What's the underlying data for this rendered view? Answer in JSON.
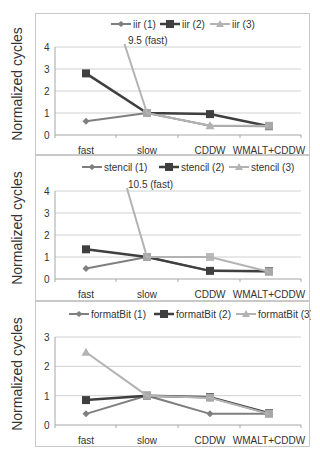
{
  "ylabel": "Normalized cycles",
  "colors": {
    "s1": "#7f7f7f",
    "s2": "#3f3f3f",
    "s3": "#b3b3b3",
    "grid": "#d0d0d0",
    "axis": "#a6a6a6"
  },
  "chart_data": [
    {
      "type": "line",
      "title": "",
      "xlabel": "",
      "ylabel": "Normalized cycles",
      "categories": [
        "fast",
        "slow",
        "CDDW",
        "WMALT+CDDW"
      ],
      "ylim": [
        0,
        4
      ],
      "yticks": [
        0,
        1,
        2,
        3,
        4
      ],
      "grid": true,
      "legend_position": "top",
      "series": [
        {
          "name": "iir (1)",
          "values": [
            0.62,
            1.0,
            0.42,
            0.4
          ]
        },
        {
          "name": "iir (2)",
          "values": [
            2.8,
            1.0,
            0.95,
            0.4
          ]
        },
        {
          "name": "iir (3)",
          "values": [
            9.5,
            1.0,
            0.42,
            0.42
          ]
        }
      ],
      "annotations": [
        {
          "text": "9.5 (fast)",
          "series": "iir (3)",
          "category": "fast"
        }
      ]
    },
    {
      "type": "line",
      "title": "",
      "xlabel": "",
      "ylabel": "Normalized cycles",
      "categories": [
        "fast",
        "slow",
        "CDDW",
        "WMALT+CDDW"
      ],
      "ylim": [
        0,
        4
      ],
      "yticks": [
        0,
        1,
        2,
        3,
        4
      ],
      "grid": true,
      "legend_position": "top",
      "series": [
        {
          "name": "stencil (1)",
          "values": [
            0.48,
            1.0,
            0.37,
            0.35
          ]
        },
        {
          "name": "stencil (2)",
          "values": [
            1.35,
            1.0,
            0.37,
            0.35
          ]
        },
        {
          "name": "stencil (3)",
          "values": [
            10.5,
            1.0,
            1.0,
            0.33
          ]
        }
      ],
      "annotations": [
        {
          "text": "10.5 (fast)",
          "series": "stencil (3)",
          "category": "fast"
        }
      ]
    },
    {
      "type": "line",
      "title": "",
      "xlabel": "",
      "ylabel": "Normalized cycles",
      "categories": [
        "fast",
        "slow",
        "CDDW",
        "WMALT+CDDW"
      ],
      "ylim": [
        0,
        3
      ],
      "yticks": [
        0,
        1,
        2,
        3
      ],
      "grid": true,
      "legend_position": "top",
      "series": [
        {
          "name": "formatBit (1)",
          "values": [
            0.38,
            1.0,
            0.38,
            0.38
          ]
        },
        {
          "name": "formatBit (2)",
          "values": [
            0.85,
            1.0,
            0.95,
            0.4
          ]
        },
        {
          "name": "formatBit (3)",
          "values": [
            2.48,
            1.0,
            0.93,
            0.38
          ]
        }
      ],
      "annotations": []
    }
  ]
}
